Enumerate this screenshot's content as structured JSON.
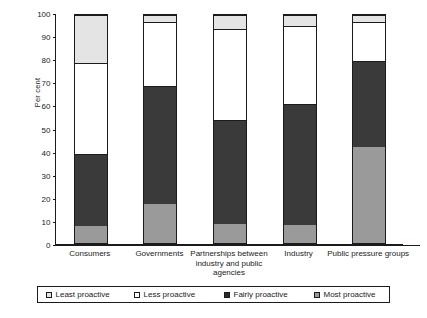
{
  "chart_data": {
    "type": "bar",
    "subtype": "stacked-100",
    "title": "",
    "xlabel": "",
    "ylabel": "Per cent",
    "ylim": [
      0,
      100
    ],
    "ytick_step": 10,
    "yticks": [
      0,
      10,
      20,
      30,
      40,
      50,
      60,
      70,
      80,
      90,
      100
    ],
    "grid": false,
    "legend_position": "bottom",
    "categories": [
      "Consumers",
      "Governments",
      "Partnerships between industry and public agencies",
      "Industry",
      "Public pressure groups"
    ],
    "series": [
      {
        "name": "Most proactive",
        "color": "#9a9a9a",
        "values": [
          7.5,
          17,
          8.5,
          8,
          42
        ]
      },
      {
        "name": "Fairly proactive",
        "color": "#3a3a3a",
        "values": [
          31.5,
          52,
          45.5,
          53,
          38
        ]
      },
      {
        "name": "Less proactive",
        "color": "#ffffff",
        "values": [
          40,
          28,
          40,
          34,
          17
        ]
      },
      {
        "name": "Least proactive",
        "color": "#e4e4e4",
        "values": [
          21,
          3,
          6,
          5,
          3
        ]
      }
    ],
    "cumulative_tops": {
      "Consumers": [
        7.5,
        39,
        79,
        100
      ],
      "Governments": [
        17,
        69,
        97,
        100
      ],
      "Partnerships between industry and public agencies": [
        8.5,
        54,
        94,
        100
      ],
      "Industry": [
        8,
        61,
        95,
        100
      ],
      "Public pressure groups": [
        42,
        80,
        97,
        100
      ]
    }
  },
  "axis": {
    "y_title": "Per cent",
    "y_tick_labels": [
      "0",
      "10",
      "20",
      "30",
      "40",
      "50",
      "60",
      "70",
      "80",
      "90",
      "100"
    ],
    "x_tick_labels": [
      "Consumers",
      "Governments",
      "Partnerships between\nindustry and public\nagencies",
      "Industry",
      "Public pressure groups"
    ]
  },
  "legend": {
    "items": [
      {
        "label": "Least proactive",
        "swatch": "light-gray-square"
      },
      {
        "label": "Less proactive",
        "swatch": "white-square"
      },
      {
        "label": "Fairly proactive",
        "swatch": "black-square"
      },
      {
        "label": "Most proactive",
        "swatch": "gray-square"
      }
    ]
  },
  "colors": {
    "most_proactive": "#9a9a9a",
    "fairly_proactive": "#3a3a3a",
    "less_proactive": "#ffffff",
    "least_proactive": "#e4e4e4",
    "axis": "#1b1b1b"
  }
}
